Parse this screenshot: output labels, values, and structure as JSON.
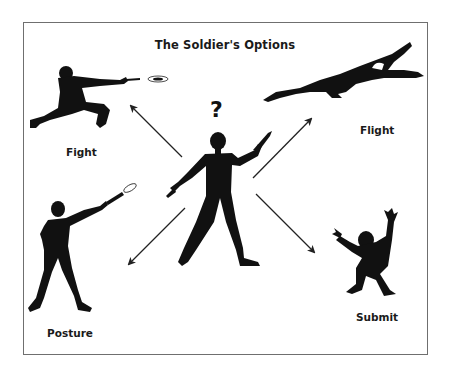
{
  "diagram": {
    "title": "The Soldier's Options",
    "center": {
      "figure": "soldier-silhouette-holding-pistol",
      "symbol": "?"
    },
    "options": [
      {
        "label": "Fight",
        "figure": "kneeling-soldier-firing",
        "position": "top-left"
      },
      {
        "label": "Flight",
        "figure": "fleeing-soldier-leaping",
        "position": "top-right"
      },
      {
        "label": "Posture",
        "figure": "standing-soldier-firing-in-air",
        "position": "bottom-left"
      },
      {
        "label": "Submit",
        "figure": "cowering-soldier-hands-up",
        "position": "bottom-right"
      }
    ],
    "arrows": [
      {
        "from": "center",
        "to": "Fight"
      },
      {
        "from": "center",
        "to": "Flight"
      },
      {
        "from": "center",
        "to": "Posture"
      },
      {
        "from": "center",
        "to": "Submit"
      }
    ],
    "colors": {
      "ink": "#111111",
      "border": "#6f6f6f",
      "background": "#ffffff"
    }
  }
}
